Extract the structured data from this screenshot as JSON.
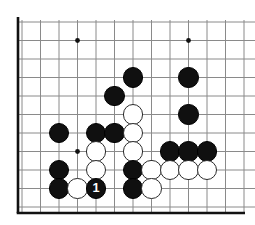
{
  "figure": {
    "kind": "go-board-diagram",
    "board": {
      "grid_color": "#8a8a8a",
      "edge_color": "#111111",
      "background": "#ffffff",
      "star_point_color": "#111111",
      "columns": 13,
      "rows": 11,
      "origin_x": 22,
      "origin_y": 22,
      "spacing": 18.5,
      "thick_left_edge_x": 18,
      "thick_bottom_edge_y": 213,
      "thick_bottom_edge_right_x": 245
    },
    "star_points": [
      {
        "name": "star-point-upper-left",
        "col": 3,
        "row": 1
      },
      {
        "name": "star-point-upper-right",
        "col": 9,
        "row": 1
      },
      {
        "name": "star-point-lower-left",
        "col": 3,
        "row": 7
      }
    ],
    "stone_radius": 10.2,
    "colors": {
      "black_stone": "#101010",
      "white_stone": "#ffffff",
      "white_stone_outline": "#2b2b2b",
      "black_label_text": "#ffffff"
    },
    "stones": [
      {
        "name": "black-stone-d6",
        "color": "black",
        "col": 6,
        "row": 3,
        "label": ""
      },
      {
        "name": "black-stone-d9",
        "color": "black",
        "col": 9,
        "row": 3,
        "label": ""
      },
      {
        "name": "black-stone-d5",
        "color": "black",
        "col": 5,
        "row": 4,
        "label": ""
      },
      {
        "name": "black-stone-e9",
        "color": "black",
        "col": 9,
        "row": 5,
        "label": ""
      },
      {
        "name": "white-stone-f6",
        "color": "white",
        "col": 6,
        "row": 5,
        "label": ""
      },
      {
        "name": "black-stone-g2",
        "color": "black",
        "col": 2,
        "row": 6,
        "label": ""
      },
      {
        "name": "black-stone-g4",
        "color": "black",
        "col": 4,
        "row": 6,
        "label": ""
      },
      {
        "name": "black-stone-g5",
        "color": "black",
        "col": 5,
        "row": 6,
        "label": ""
      },
      {
        "name": "white-stone-g6",
        "color": "white",
        "col": 6,
        "row": 6,
        "label": ""
      },
      {
        "name": "white-stone-h4",
        "color": "white",
        "col": 4,
        "row": 7,
        "label": ""
      },
      {
        "name": "white-stone-h6",
        "color": "white",
        "col": 6,
        "row": 7,
        "label": ""
      },
      {
        "name": "black-stone-h8",
        "color": "black",
        "col": 8,
        "row": 7,
        "label": ""
      },
      {
        "name": "black-stone-h9",
        "color": "black",
        "col": 9,
        "row": 7,
        "label": ""
      },
      {
        "name": "black-stone-h10",
        "color": "black",
        "col": 10,
        "row": 7,
        "label": ""
      },
      {
        "name": "black-stone-i2",
        "color": "black",
        "col": 2,
        "row": 8,
        "label": ""
      },
      {
        "name": "white-stone-i4",
        "color": "white",
        "col": 4,
        "row": 8,
        "label": ""
      },
      {
        "name": "black-stone-i6",
        "color": "black",
        "col": 6,
        "row": 8,
        "label": ""
      },
      {
        "name": "white-stone-i7",
        "color": "white",
        "col": 7,
        "row": 8,
        "label": ""
      },
      {
        "name": "white-stone-i8",
        "color": "white",
        "col": 8,
        "row": 8,
        "label": ""
      },
      {
        "name": "white-stone-i9",
        "color": "white",
        "col": 9,
        "row": 8,
        "label": ""
      },
      {
        "name": "white-stone-i10",
        "color": "white",
        "col": 10,
        "row": 8,
        "label": ""
      },
      {
        "name": "black-stone-j2",
        "color": "black",
        "col": 2,
        "row": 9,
        "label": ""
      },
      {
        "name": "white-stone-j3",
        "color": "white",
        "col": 3,
        "row": 9,
        "label": ""
      },
      {
        "name": "black-stone-move-1",
        "color": "black",
        "col": 4,
        "row": 9,
        "label": "1"
      },
      {
        "name": "black-stone-j6",
        "color": "black",
        "col": 6,
        "row": 9,
        "label": ""
      },
      {
        "name": "white-stone-j7",
        "color": "white",
        "col": 7,
        "row": 9,
        "label": ""
      }
    ],
    "move_markers": [
      {
        "name": "move-number-1",
        "number": "1",
        "color": "black",
        "col": 4,
        "row": 9
      }
    ]
  }
}
